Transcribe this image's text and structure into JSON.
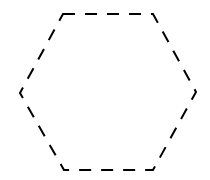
{
  "diagram": {
    "shape": "hexagon",
    "style": "dashed-outline",
    "stroke_color": "#000000",
    "background_color": "#ffffff",
    "vertices": [
      [
        63,
        14
      ],
      [
        153,
        14
      ],
      [
        196,
        92
      ],
      [
        153,
        170
      ],
      [
        64,
        170
      ],
      [
        20,
        93
      ]
    ]
  }
}
